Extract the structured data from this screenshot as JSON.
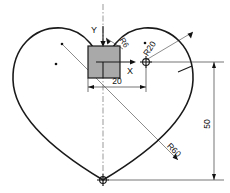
{
  "drawing": {
    "title": "Heart profile construction drawing",
    "axes": {
      "x_label": "X",
      "y_label": "Y"
    },
    "dimensions": [
      {
        "name": "radius-small",
        "label": "R6",
        "value": 6,
        "kind": "radius"
      },
      {
        "name": "radius-lobe",
        "label": "R20",
        "value": 20,
        "kind": "radius"
      },
      {
        "name": "radius-large",
        "label": "R60",
        "value": 60,
        "kind": "radius"
      },
      {
        "name": "horizontal-offset",
        "label": "20",
        "value": 20,
        "kind": "linear"
      },
      {
        "name": "vertical-height",
        "label": "50",
        "value": 50,
        "kind": "linear"
      }
    ],
    "labels": {
      "r6": "R6",
      "r20": "R20",
      "r60": "R60",
      "dim20": "20",
      "dim50": "50",
      "x": "X",
      "y": "Y"
    },
    "colors": {
      "outline": "#1a1a1a",
      "fill_square": "#a9a9a9",
      "dimension_line": "#3a3a3a",
      "construction_line": "#6e6e6e",
      "background": "#ffffff"
    }
  }
}
